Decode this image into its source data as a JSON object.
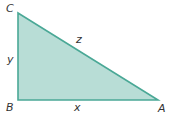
{
  "diagram": {
    "type": "right-triangle",
    "fill_color": "#b8ddd6",
    "stroke_color": "#4aa896",
    "vertices": {
      "C": {
        "label": "C",
        "x": 18,
        "y": 13
      },
      "B": {
        "label": "B",
        "x": 18,
        "y": 100
      },
      "A": {
        "label": "A",
        "x": 158,
        "y": 100
      }
    },
    "sides": {
      "y": {
        "label": "y",
        "between": "C-B"
      },
      "x": {
        "label": "x",
        "between": "B-A"
      },
      "z": {
        "label": "z",
        "between": "C-A"
      }
    },
    "right_angle_at": "B"
  }
}
